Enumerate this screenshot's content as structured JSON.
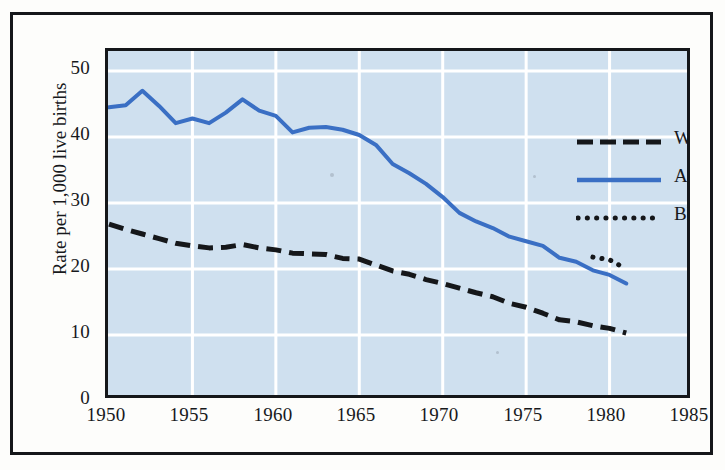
{
  "chart_data": {
    "type": "line",
    "title": "",
    "xlabel": "",
    "ylabel": "Rate per 1,000 live births",
    "xlim": [
      1950,
      1985
    ],
    "ylim": [
      0,
      50
    ],
    "grid": true,
    "legend_position": "upper right",
    "x_ticks": [
      1950,
      1955,
      1960,
      1965,
      1970,
      1975,
      1980,
      1985
    ],
    "y_ticks": [
      0,
      10,
      20,
      30,
      40,
      50
    ],
    "plot_background": "#cfe0ef",
    "gridline_color": "#ffffff",
    "series": [
      {
        "name": "White",
        "style": "dashed",
        "color": "#15171a",
        "x": [
          1950,
          1951,
          1952,
          1953,
          1954,
          1955,
          1956,
          1957,
          1958,
          1959,
          1960,
          1961,
          1962,
          1963,
          1964,
          1965,
          1966,
          1967,
          1968,
          1969,
          1970,
          1971,
          1972,
          1973,
          1974,
          1975,
          1976,
          1977,
          1978,
          1979,
          1980,
          1981
        ],
        "values": [
          26.8,
          26.0,
          25.3,
          24.6,
          23.9,
          23.5,
          23.2,
          23.3,
          23.7,
          23.2,
          22.9,
          22.4,
          22.3,
          22.2,
          21.6,
          21.5,
          20.6,
          19.7,
          19.2,
          18.4,
          17.8,
          17.1,
          16.4,
          15.8,
          14.8,
          14.2,
          13.3,
          12.3,
          12.0,
          11.4,
          11.0,
          10.3
        ]
      },
      {
        "name": "All other",
        "style": "solid",
        "color": "#3a6fc4",
        "x": [
          1950,
          1951,
          1952,
          1953,
          1954,
          1955,
          1956,
          1957,
          1958,
          1959,
          1960,
          1961,
          1962,
          1963,
          1964,
          1965,
          1966,
          1967,
          1968,
          1969,
          1970,
          1971,
          1972,
          1973,
          1974,
          1975,
          1976,
          1977,
          1978,
          1979,
          1980,
          1981
        ],
        "values": [
          44.5,
          44.8,
          47.0,
          44.7,
          42.1,
          42.8,
          42.1,
          43.7,
          45.7,
          44.0,
          43.2,
          40.7,
          41.4,
          41.5,
          41.1,
          40.3,
          38.8,
          35.9,
          34.5,
          32.9,
          30.9,
          28.5,
          27.2,
          26.2,
          24.9,
          24.2,
          23.5,
          21.7,
          21.1,
          19.8,
          19.1,
          17.8
        ]
      },
      {
        "name": "Black",
        "style": "dotted",
        "color": "#15171a",
        "x": [
          1979,
          1980,
          1981
        ],
        "values": [
          21.8,
          21.4,
          20.0
        ]
      }
    ]
  },
  "legend": {
    "items": [
      {
        "label": "White",
        "style": "dashed",
        "color": "#15171a"
      },
      {
        "label": "All other",
        "style": "solid",
        "color": "#3a6fc4"
      },
      {
        "label": "Black",
        "style": "dotted",
        "color": "#15171a"
      }
    ]
  },
  "axes": {
    "y_title": "Rate per 1,000 live births",
    "y_tick_labels": [
      "50",
      "40",
      "30",
      "20",
      "10",
      "0"
    ],
    "x_tick_labels": [
      "1950",
      "1955",
      "1960",
      "1965",
      "1970",
      "1975",
      "1980",
      "1985"
    ]
  }
}
